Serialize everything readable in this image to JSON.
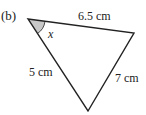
{
  "figure": {
    "part_label": "(b)",
    "angle_label": "x",
    "sides": {
      "top": "6.5 cm",
      "left": "5 cm",
      "right": "7 cm"
    },
    "colors": {
      "stroke": "#222222",
      "angle_fill": "#c8c8c8"
    }
  }
}
